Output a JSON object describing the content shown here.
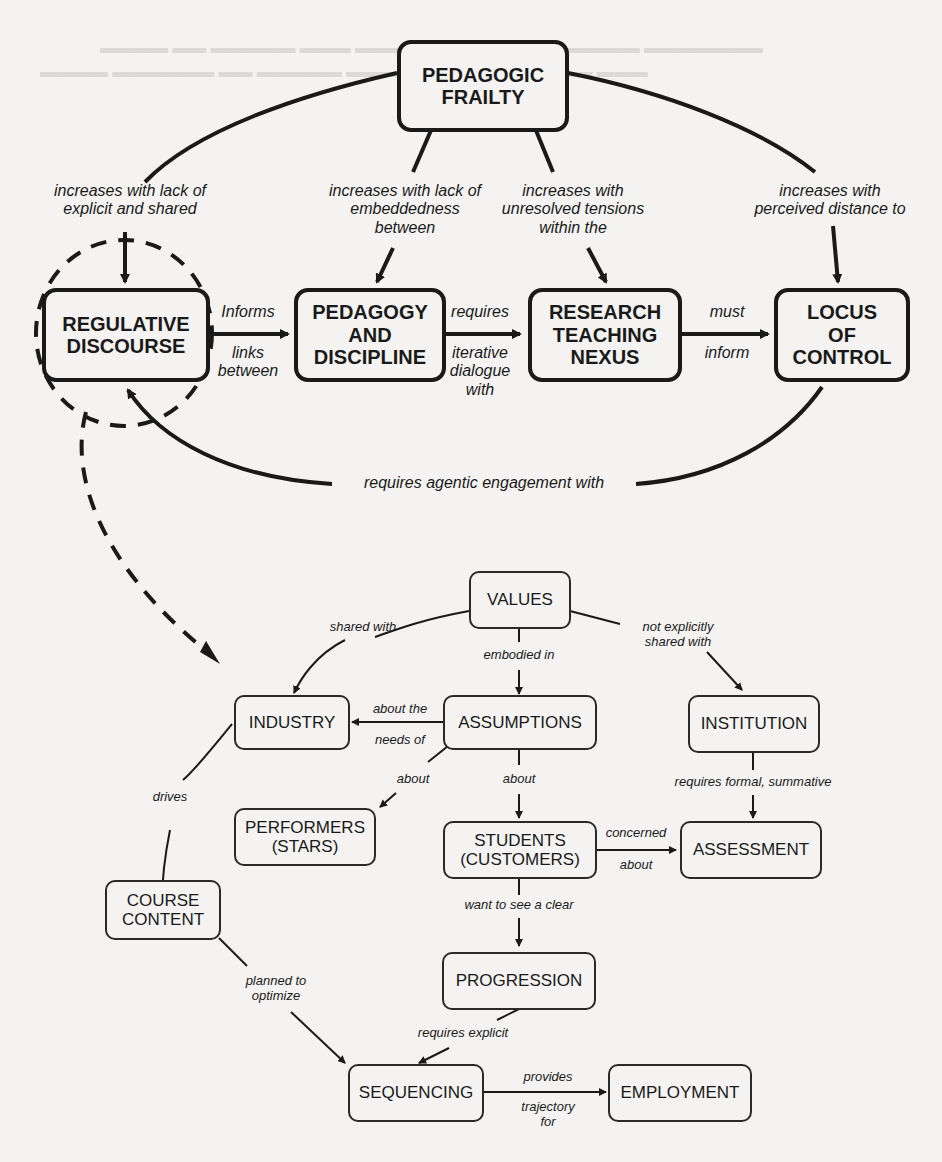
{
  "diagram": {
    "upper": {
      "nodes": {
        "pedagogic_frailty": "PEDAGOGIC\nFRAILTY",
        "regulative_discourse": "REGULATIVE\nDISCOURSE",
        "pedagogy_discipline": "PEDAGOGY\nAND\nDISCIPLINE",
        "research_teaching_nexus": "RESEARCH\nTEACHING\nNEXUS",
        "locus_of_control": "LOCUS\nOF\nCONTROL"
      },
      "edges": {
        "frailty_to_regulative": "increases with lack of\nexplicit and shared",
        "frailty_to_pedagogy": "increases with lack of\nembeddedness\nbetween",
        "frailty_to_nexus": "increases with\nunresolved tensions\nwithin the",
        "frailty_to_locus": "increases with\nperceived distance to",
        "regulative_to_pedagogy_top": "Informs",
        "regulative_to_pedagogy_bottom": "links\nbetween",
        "pedagogy_nexus_top": "requires",
        "pedagogy_nexus_bottom": "iterative\ndialogue\nwith",
        "nexus_to_locus_top": "must",
        "nexus_to_locus_bottom": "inform",
        "locus_to_regulative": "requires agentic engagement with"
      }
    },
    "lower": {
      "nodes": {
        "values": "VALUES",
        "industry": "INDUSTRY",
        "assumptions": "ASSUMPTIONS",
        "institution": "INSTITUTION",
        "performers": "PERFORMERS\n(STARS)",
        "students": "STUDENTS\n(CUSTOMERS)",
        "assessment": "ASSESSMENT",
        "course_content": "COURSE\nCONTENT",
        "progression": "PROGRESSION",
        "sequencing": "SEQUENCING",
        "employment": "EMPLOYMENT"
      },
      "edges": {
        "values_to_industry": "shared with",
        "values_to_assumptions": "embodied in",
        "values_to_institution": "not explicitly\nshared with",
        "assumptions_to_industry_top": "about the",
        "assumptions_to_industry_bottom": "needs of",
        "assumptions_to_performers": "about",
        "assumptions_to_students": "about",
        "institution_to_assessment": "requires formal, summative",
        "industry_to_course": "drives",
        "students_to_assessment_top": "concerned",
        "students_to_assessment_bottom": "about",
        "students_to_progression": "want to see a clear",
        "course_to_sequencing": "planned to\noptimize",
        "progression_to_sequencing": "requires explicit",
        "sequencing_to_employment_top": "provides",
        "sequencing_to_employment_bottom": "trajectory\nfor"
      }
    }
  },
  "colors": {
    "ink": "#1a1a1a",
    "paper": "#f4f3f1"
  }
}
